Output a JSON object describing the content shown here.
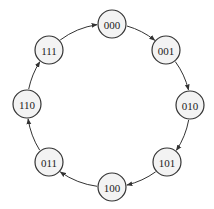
{
  "diagram": {
    "type": "state-cycle",
    "nodes": [
      {
        "id": "000",
        "label": "000",
        "x": 112,
        "y": 24
      },
      {
        "id": "001",
        "label": "001",
        "x": 166,
        "y": 50
      },
      {
        "id": "010",
        "label": "010",
        "x": 190,
        "y": 105
      },
      {
        "id": "101",
        "label": "101",
        "x": 167,
        "y": 162
      },
      {
        "id": "100",
        "label": "100",
        "x": 112,
        "y": 187
      },
      {
        "id": "011",
        "label": "011",
        "x": 49,
        "y": 162
      },
      {
        "id": "110",
        "label": "110",
        "x": 27,
        "y": 104
      },
      {
        "id": "111",
        "label": "111",
        "x": 49,
        "y": 50
      }
    ],
    "edges": [
      {
        "from": "000",
        "to": "001"
      },
      {
        "from": "001",
        "to": "010"
      },
      {
        "from": "010",
        "to": "101"
      },
      {
        "from": "101",
        "to": "100"
      },
      {
        "from": "100",
        "to": "011"
      },
      {
        "from": "011",
        "to": "110"
      },
      {
        "from": "110",
        "to": "111"
      },
      {
        "from": "111",
        "to": "000"
      }
    ],
    "node_radius": 14,
    "colors": {
      "node_fill": "#f3f3f3",
      "stroke": "#333333",
      "text": "#222222"
    }
  }
}
